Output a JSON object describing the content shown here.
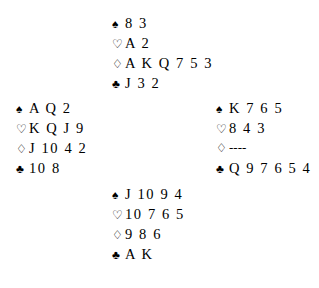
{
  "deal": {
    "suit_symbols": {
      "spade": "♠",
      "heart": "♡",
      "diamond": "♢",
      "club": "♣"
    },
    "void_marker": "----",
    "colors": {
      "ink": "#000000",
      "background": "#ffffff"
    },
    "hands": {
      "north": {
        "position_label": "North",
        "spades": "8 3",
        "hearts": "A 2",
        "diamonds": "A K Q 7 5 3",
        "clubs": "J 3 2"
      },
      "west": {
        "position_label": "West",
        "spades": "A Q 2",
        "hearts": "K Q J 9",
        "diamonds": "J 10 4 2",
        "clubs": "10 8"
      },
      "east": {
        "position_label": "East",
        "spades": "K 7 6 5",
        "hearts": "8 4 3",
        "diamonds": "----",
        "clubs": "Q 9 7 6 5 4"
      },
      "south": {
        "position_label": "South",
        "spades": "J 10 9 4",
        "hearts": "10 7 6 5",
        "diamonds": "9 8 6",
        "clubs": "A K"
      }
    }
  }
}
